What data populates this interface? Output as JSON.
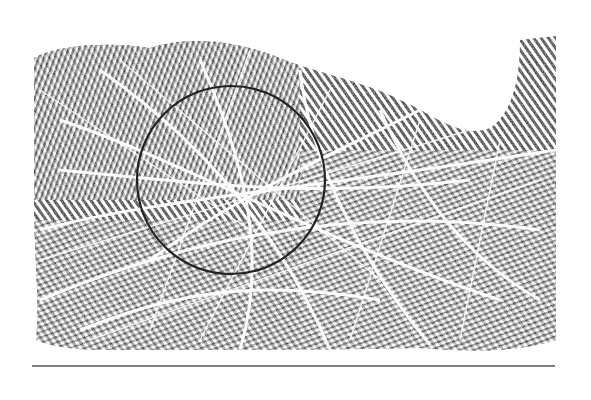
{
  "figure": {
    "type": "palmprint",
    "annotation": {
      "shape": "circle",
      "cx": 231,
      "cy": 180,
      "r": 94,
      "stroke": "#222222"
    },
    "rule": {
      "x1": 32,
      "x2": 555,
      "y": 366,
      "stroke": "#555555"
    },
    "ink_color": "#3a3a3a",
    "background": "#ffffff"
  }
}
